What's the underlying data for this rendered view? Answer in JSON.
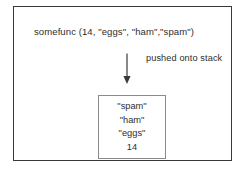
{
  "figure": {
    "call_expression": "somefunc (14, \"eggs\", \"ham\",\"spam\")",
    "annotation": "pushed onto stack",
    "arrow": {
      "icon": "arrow-down-icon",
      "direction": "down"
    },
    "stack": {
      "entries": [
        {
          "label": "\"spam\""
        },
        {
          "label": "\"ham\""
        },
        {
          "label": "\"eggs\""
        },
        {
          "label": "14"
        }
      ]
    },
    "colors": {
      "outer_border": "#3a3a3a",
      "stack_border": "#8a8a8a",
      "text": "#2e2e2e",
      "background": "#ffffff"
    }
  }
}
